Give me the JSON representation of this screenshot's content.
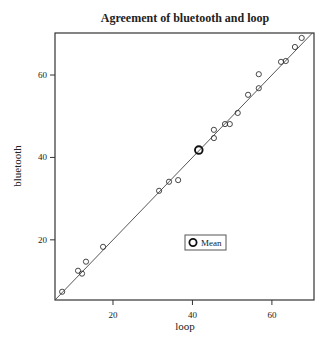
{
  "chart_data": {
    "type": "scatter",
    "title": "Agreement of bluetooth and loop",
    "xlabel": "loop",
    "ylabel": "bluetooth",
    "xlim": [
      5.4,
      70.6
    ],
    "ylim": [
      5.4,
      70.2
    ],
    "xticks": [
      20,
      40,
      60
    ],
    "yticks": [
      20,
      40,
      60
    ],
    "grid": false,
    "legend": {
      "position": "inside-bottom-center",
      "entries": [
        "Mean"
      ]
    },
    "reference_line": {
      "type": "identity",
      "label": "y = x"
    },
    "series": [
      {
        "name": "observations",
        "marker": "open-circle",
        "points": [
          {
            "x": 7.2,
            "y": 7.4
          },
          {
            "x": 12.2,
            "y": 11.8
          },
          {
            "x": 11.2,
            "y": 12.5
          },
          {
            "x": 13.2,
            "y": 14.7
          },
          {
            "x": 17.5,
            "y": 18.3
          },
          {
            "x": 31.6,
            "y": 31.9
          },
          {
            "x": 34.1,
            "y": 34.1
          },
          {
            "x": 36.4,
            "y": 34.5
          },
          {
            "x": 45.4,
            "y": 44.7
          },
          {
            "x": 45.4,
            "y": 46.7
          },
          {
            "x": 48.2,
            "y": 48.1
          },
          {
            "x": 49.4,
            "y": 48.1
          },
          {
            "x": 51.4,
            "y": 50.8
          },
          {
            "x": 54.0,
            "y": 55.2
          },
          {
            "x": 56.7,
            "y": 56.8
          },
          {
            "x": 56.7,
            "y": 60.2
          },
          {
            "x": 62.3,
            "y": 63.2
          },
          {
            "x": 63.5,
            "y": 63.4
          },
          {
            "x": 65.8,
            "y": 66.8
          },
          {
            "x": 67.5,
            "y": 69.0
          }
        ]
      },
      {
        "name": "Mean",
        "marker": "bold-open-circle",
        "points": [
          {
            "x": 41.6,
            "y": 41.8
          }
        ]
      }
    ]
  },
  "labels": {
    "title": "Agreement of bluetooth and loop",
    "xlabel": "loop",
    "ylabel": "bluetooth",
    "legend_mean": "Mean",
    "xtick_labels": [
      "20",
      "40",
      "60"
    ],
    "ytick_labels": [
      "20",
      "40",
      "60"
    ]
  }
}
